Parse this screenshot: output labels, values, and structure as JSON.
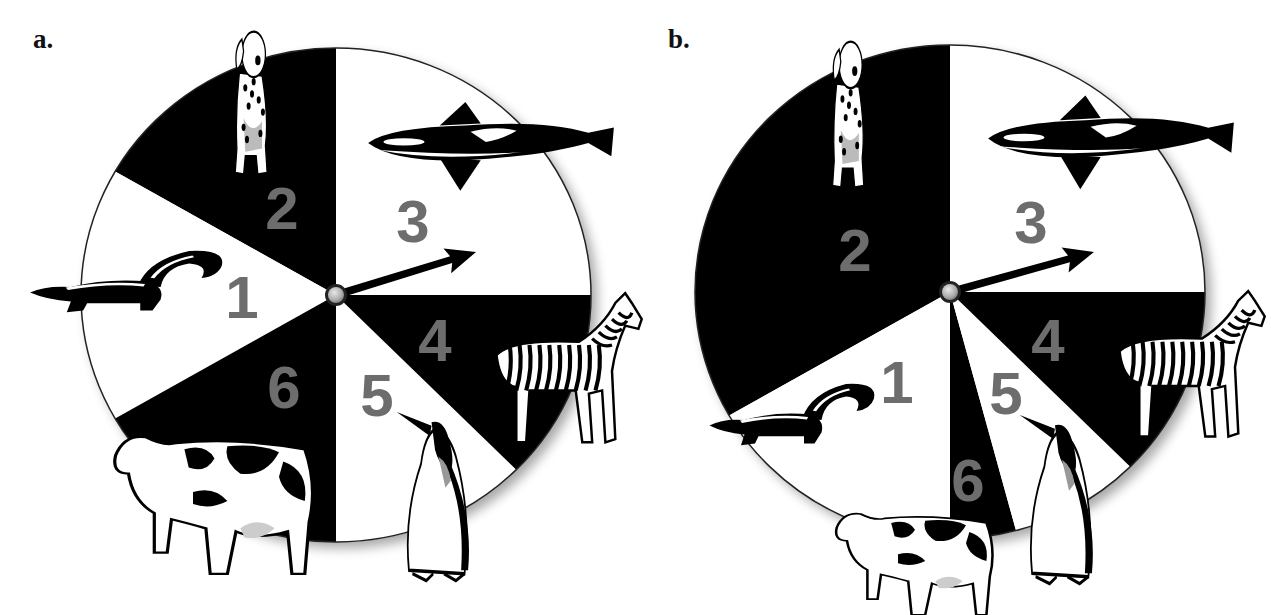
{
  "panels": [
    {
      "label": "a.",
      "label_pos": [
        33,
        26
      ],
      "center": [
        336,
        295
      ],
      "rx": 255,
      "ry": 247,
      "arrow_tip": [
        476,
        252
      ],
      "sectors": [
        {
          "number": "3",
          "animal": "orca",
          "fill": "#ffffff",
          "start_deg": 0,
          "end_deg": 90,
          "label_pos": [
            413,
            221
          ]
        },
        {
          "number": "2",
          "animal": "dalmatian",
          "fill": "#000000",
          "start_deg": 90,
          "end_deg": 150,
          "label_pos": [
            282,
            208
          ]
        },
        {
          "number": "1",
          "animal": "skunk",
          "fill": "#ffffff",
          "start_deg": 150,
          "end_deg": 210,
          "label_pos": [
            242,
            297
          ]
        },
        {
          "number": "6",
          "animal": "cow",
          "fill": "#000000",
          "start_deg": 210,
          "end_deg": 270,
          "label_pos": [
            284,
            387
          ]
        },
        {
          "number": "5",
          "animal": "penguin",
          "fill": "#ffffff",
          "start_deg": 270,
          "end_deg": 315,
          "label_pos": [
            377,
            395
          ]
        },
        {
          "number": "4",
          "animal": "zebra",
          "fill": "#000000",
          "start_deg": 315,
          "end_deg": 360,
          "label_pos": [
            435,
            340
          ]
        }
      ],
      "animals": {
        "dalmatian": [
          210,
          27,
          84,
          152
        ],
        "orca": [
          363,
          97,
          256,
          102
        ],
        "skunk": [
          26,
          242,
          204,
          90
        ],
        "zebra": [
          480,
          290,
          165,
          162
        ],
        "penguin": [
          395,
          412,
          87,
          172
        ],
        "cow": [
          107,
          425,
          215,
          152
        ]
      }
    },
    {
      "label": "b.",
      "label_pos": [
        668,
        26
      ],
      "center": [
        950,
        292
      ],
      "rx": 255,
      "ry": 247,
      "arrow_tip": [
        1094,
        252
      ],
      "sectors": [
        {
          "number": "3",
          "animal": "orca",
          "fill": "#ffffff",
          "start_deg": 0,
          "end_deg": 90,
          "label_pos": [
            1031,
            222
          ]
        },
        {
          "number": "2",
          "animal": "dalmatian",
          "fill": "#000000",
          "start_deg": 90,
          "end_deg": 210,
          "label_pos": [
            855,
            250
          ]
        },
        {
          "number": "1",
          "animal": "skunk",
          "fill": "#ffffff",
          "start_deg": 210,
          "end_deg": 270,
          "label_pos": [
            897,
            382
          ]
        },
        {
          "number": "6",
          "animal": "cow",
          "fill": "#000000",
          "start_deg": 270,
          "end_deg": 285,
          "label_pos": [
            968,
            480
          ]
        },
        {
          "number": "5",
          "animal": "penguin",
          "fill": "#ffffff",
          "start_deg": 285,
          "end_deg": 315,
          "label_pos": [
            1006,
            393
          ]
        },
        {
          "number": "4",
          "animal": "zebra",
          "fill": "#000000",
          "start_deg": 315,
          "end_deg": 360,
          "label_pos": [
            1048,
            340
          ]
        }
      ],
      "animals": {
        "dalmatian": [
          808,
          37,
          82,
          155
        ],
        "orca": [
          983,
          90,
          256,
          108
        ],
        "skunk": [
          706,
          375,
          175,
          90
        ],
        "zebra": [
          1103,
          288,
          165,
          158
        ],
        "penguin": [
          1018,
          415,
          88,
          172
        ],
        "cow": [
          830,
          505,
          170,
          112
        ]
      }
    }
  ],
  "colors": {
    "dark_sector": "#000000",
    "light_sector": "#ffffff",
    "number_gray": "#6d6d6d",
    "rim": "#222222",
    "hub": "#b8b8b8"
  }
}
